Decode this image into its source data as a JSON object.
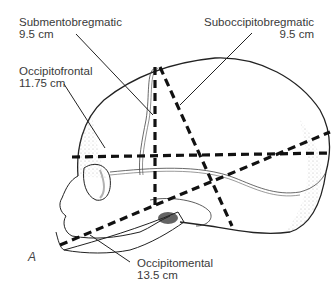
{
  "figure": {
    "panel_label": "A"
  },
  "labels": {
    "submentobregmatic": {
      "name": "Submentobregmatic",
      "value": "9.5 cm"
    },
    "suboccipitobregmatic": {
      "name": "Suboccipitobregmatic",
      "value": "9.5 cm"
    },
    "occipitofrontal": {
      "name": "Occipitofrontal",
      "value": "11.75 cm"
    },
    "occipitomental": {
      "name": "Occipitomental",
      "value": "13.5 cm"
    }
  },
  "colors": {
    "line": "#111111",
    "text": "#3a3a3a",
    "stipple": "#888888"
  }
}
